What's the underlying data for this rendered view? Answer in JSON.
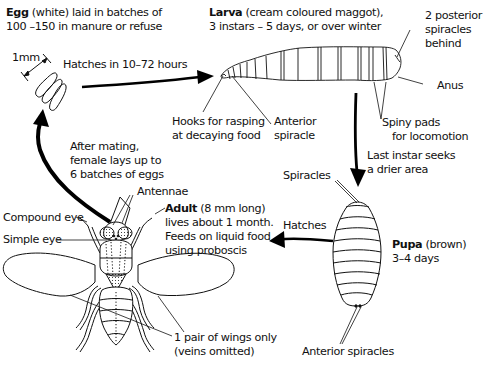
{
  "diagram": {
    "stages": {
      "egg": {
        "name": "Egg",
        "desc_line1": " (white) laid in batches of",
        "desc_line2": "100 –150 in manure or refuse",
        "scale": "1mm",
        "hatch_note": "Hatches in 10–72 hours"
      },
      "larva": {
        "name": "Larva",
        "desc_line1": " (cream coloured maggot),",
        "desc_line2": "3 instars – 5 days, or over winter",
        "labels": {
          "posterior_spiracles": [
            "2 posterior",
            "spiracles",
            "behind"
          ],
          "anus": "Anus",
          "hooks": [
            "Hooks for rasping",
            "at decaying food"
          ],
          "anterior_spiracle": [
            "Anterior",
            "spiracle"
          ],
          "spiny_pads": [
            "Spiny pads",
            "for locomotion"
          ]
        },
        "transition_note": [
          "Last instar seeks",
          "a drier area"
        ]
      },
      "pupa": {
        "name": "Pupa",
        "desc_line1": " (brown)",
        "desc_line2": "3–4 days",
        "labels": {
          "spiracles": "Spiracles",
          "anterior_spiracles": "Anterior spiracles"
        },
        "transition_note": "Hatches"
      },
      "adult": {
        "name": "Adult",
        "desc_line1": " (8 mm long)",
        "desc_line2": "lives about 1 month.",
        "desc_line3": "Feeds on liquid food",
        "desc_line4": "using proboscis",
        "labels": {
          "antennae": "Antennae",
          "compound_eye": "Compound eye",
          "simple_eye": "Simple eye",
          "wings": [
            "1 pair of wings only",
            "(veins omitted)"
          ]
        },
        "transition_note": [
          "After mating,",
          "female lays up to",
          "6 batches of eggs"
        ]
      }
    }
  }
}
